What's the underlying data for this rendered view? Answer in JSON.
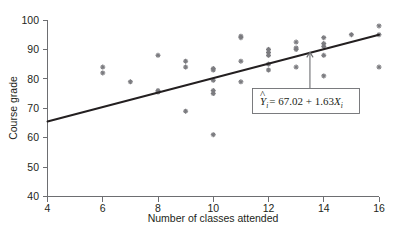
{
  "chart_data": {
    "type": "scatter",
    "title": "",
    "xlabel": "Number of classes attended",
    "ylabel": "Course grade",
    "xlim": [
      4,
      16
    ],
    "ylim": [
      40,
      100
    ],
    "xticks": [
      4,
      6,
      8,
      10,
      12,
      14,
      16
    ],
    "yticks": [
      40,
      50,
      60,
      70,
      80,
      90,
      100
    ],
    "xtick_labels": [
      "4",
      "6",
      "8",
      "10",
      "12",
      "14",
      "16"
    ],
    "ytick_labels": [
      "40",
      "50",
      "60",
      "70",
      "80",
      "90",
      "100"
    ],
    "grid": false,
    "legend": "none",
    "marker_style": "cross",
    "marker_color": "#7b7b7f",
    "line_color": "#231f20",
    "points": [
      {
        "x": 6,
        "y": 84
      },
      {
        "x": 6,
        "y": 82
      },
      {
        "x": 7,
        "y": 79
      },
      {
        "x": 8,
        "y": 88
      },
      {
        "x": 8,
        "y": 76
      },
      {
        "x": 8,
        "y": 75.5
      },
      {
        "x": 9,
        "y": 86
      },
      {
        "x": 9,
        "y": 84
      },
      {
        "x": 9,
        "y": 69
      },
      {
        "x": 10,
        "y": 83.5
      },
      {
        "x": 10,
        "y": 83
      },
      {
        "x": 10,
        "y": 79.5
      },
      {
        "x": 10,
        "y": 76
      },
      {
        "x": 10,
        "y": 75
      },
      {
        "x": 10,
        "y": 61
      },
      {
        "x": 11,
        "y": 94.5
      },
      {
        "x": 11,
        "y": 94
      },
      {
        "x": 11,
        "y": 86
      },
      {
        "x": 11,
        "y": 79
      },
      {
        "x": 12,
        "y": 90
      },
      {
        "x": 12,
        "y": 89
      },
      {
        "x": 12,
        "y": 88
      },
      {
        "x": 12,
        "y": 85
      },
      {
        "x": 12,
        "y": 83
      },
      {
        "x": 13,
        "y": 92.5
      },
      {
        "x": 13,
        "y": 90.5
      },
      {
        "x": 13,
        "y": 90
      },
      {
        "x": 13,
        "y": 84
      },
      {
        "x": 14,
        "y": 94
      },
      {
        "x": 14,
        "y": 92
      },
      {
        "x": 14,
        "y": 91
      },
      {
        "x": 14,
        "y": 88
      },
      {
        "x": 14,
        "y": 81
      },
      {
        "x": 15,
        "y": 95
      },
      {
        "x": 16,
        "y": 98
      },
      {
        "x": 16,
        "y": 95
      },
      {
        "x": 16,
        "y": 84
      }
    ],
    "regression": {
      "intercept": 67.02,
      "slope": 1.63,
      "x_start": 4,
      "x_end": 16,
      "y_start": 65.5,
      "y_end": 95
    },
    "annotation": {
      "equation": "= 67.02 + 1.63",
      "y_hat_symbol": "Y",
      "y_hat_subscript": "i",
      "x_symbol": "X",
      "x_subscript": "i",
      "hat_accent": "^",
      "arrow_target_x": 13.5,
      "arrow_target_y": 89
    }
  }
}
